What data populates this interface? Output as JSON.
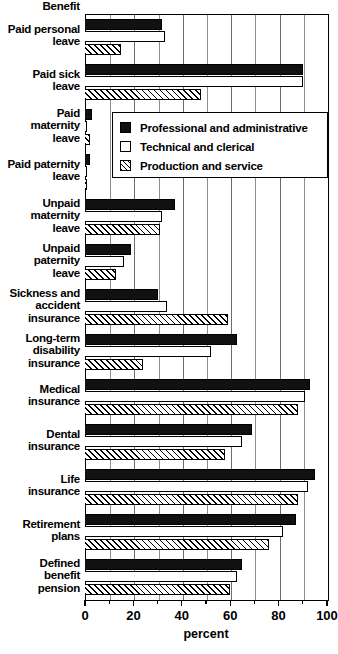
{
  "chart_data": {
    "type": "bar",
    "orientation": "horizontal",
    "title": "",
    "ylabel": "Benefit",
    "xlabel": "percent",
    "xlim": [
      0,
      100
    ],
    "xticks": [
      0,
      20,
      40,
      60,
      80,
      100
    ],
    "xtick_labels": [
      "0",
      "20",
      "40",
      "60",
      "80",
      "100"
    ],
    "minor_tick_step": 10,
    "grid": true,
    "grid_axis": "x",
    "legend_position": "upper-center-inset",
    "categories": [
      "Paid personal leave",
      "Paid sick leave",
      "Paid maternity leave",
      "Paid paternity leave",
      "Unpaid maternity leave",
      "Unpaid paternity leave",
      "Sickness and accident insurance",
      "Long-term disability insurance",
      "Medical insurance",
      "Dental insurance",
      "Life insurance",
      "Retirement plans",
      "Defined benefit pension"
    ],
    "category_label_lines": [
      [
        "Paid personal",
        "leave"
      ],
      [
        "Paid sick",
        "leave"
      ],
      [
        "Paid",
        "maternity",
        "leave"
      ],
      [
        "Paid paternity",
        "leave"
      ],
      [
        "Unpaid",
        "maternity",
        "leave"
      ],
      [
        "Unpaid",
        "paternity",
        "leave"
      ],
      [
        "Sickness and",
        "accident",
        "insurance"
      ],
      [
        "Long-term",
        "disability",
        "insurance"
      ],
      [
        "Medical",
        "insurance"
      ],
      [
        "Dental",
        "insurance"
      ],
      [
        "Life",
        "insurance"
      ],
      [
        "Retirement",
        "plans"
      ],
      [
        "Defined",
        "benefit",
        "pension"
      ]
    ],
    "series": [
      {
        "name": "Professional and administrative",
        "fill": "solid-black",
        "color": "#111111",
        "values": [
          32,
          90,
          3,
          2,
          37,
          19,
          30,
          63,
          93,
          69,
          95,
          87,
          65
        ]
      },
      {
        "name": "Technical and clerical",
        "fill": "open-white",
        "color": "#ffffff",
        "values": [
          33,
          90,
          1,
          1,
          32,
          16,
          34,
          52,
          91,
          65,
          92,
          82,
          63
        ]
      },
      {
        "name": "Production and service",
        "fill": "diagonal-hatch",
        "color": "#ffffff",
        "values": [
          15,
          48,
          2,
          1,
          31,
          13,
          59,
          24,
          88,
          58,
          88,
          76,
          60
        ]
      }
    ]
  }
}
